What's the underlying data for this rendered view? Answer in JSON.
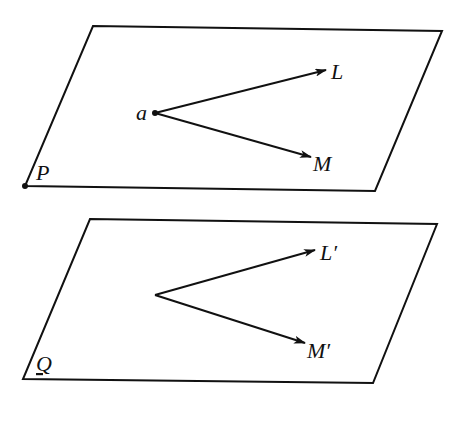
{
  "diagram": {
    "planes": [
      {
        "name": "P",
        "label": "P",
        "vertices": [
          [
            93,
            26
          ],
          [
            442,
            31
          ],
          [
            375,
            191
          ],
          [
            25,
            186
          ]
        ],
        "corner_dot": true
      },
      {
        "name": "Q",
        "label": "Q",
        "vertices": [
          [
            90,
            219
          ],
          [
            437,
            224
          ],
          [
            373,
            383
          ],
          [
            23,
            379
          ]
        ],
        "corner_dot": false
      }
    ],
    "point_label": "a",
    "vectors": [
      {
        "from_plane": "P",
        "label": "L",
        "start": [
          155,
          113
        ],
        "end": [
          326,
          70
        ]
      },
      {
        "from_plane": "P",
        "label": "M",
        "start": [
          155,
          113
        ],
        "end": [
          311,
          157
        ]
      },
      {
        "from_plane": "Q",
        "label": "L′",
        "start": [
          155,
          295
        ],
        "end": [
          315,
          250
        ]
      },
      {
        "from_plane": "Q",
        "label": "M′",
        "start": [
          155,
          295
        ],
        "end": [
          305,
          343
        ]
      }
    ],
    "stroke_color": "#111111"
  }
}
